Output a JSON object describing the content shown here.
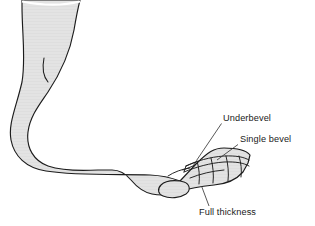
{
  "figure": {
    "colors": {
      "skin_fill": "#e3e3e3",
      "outline": "#1c1c1c",
      "leader_line": "#3a3a3a",
      "label_text": "#1a1a1a",
      "background": "#ffffff"
    },
    "labels": [
      {
        "id": "underbevel",
        "text": "Underbevel",
        "text_x": 223,
        "text_y": 121,
        "leader": "M221.5,123.5 L196.5,160.5"
      },
      {
        "id": "single-bevel",
        "text": "Single bevel",
        "text_x": 240,
        "text_y": 142,
        "leader": "M238,144.5 L217,160"
      },
      {
        "id": "full-thickness",
        "text": "Full thickness",
        "text_x": 199,
        "text_y": 215,
        "leader": "M209,206 L201.5,186"
      }
    ],
    "anatomy": {
      "foot_outline": "M22,0 L22,6 C22,34 26,58 22,82 C16,108 8,124 11,140 C14,156 26,168 46,171 C78,176 120,174 150,175 C162,175.5 172,178 180,181 L196,164 C208,152 214,148 224,148 C236,148 246,150 250,155 L248,163 L243,172 C236,180 226,184 214,185 C200,186.5 190,188 182,191 C172,195 162,196 152,194 C142,192 136,186 131,180 C126,174 120,170 112,170 L98,170 C80,171 60,170 48,166 C34,161 26,148 28,132 C30,116 40,104 48,92 C60,74 70,52 74,30 C76,18 78,8 80,0 Z",
      "leg_top_edge": "M22,1.5 C40,5 62,6 80,1.5",
      "malleolus_mark": "M44,58 C42,68 43,76 48,82",
      "toe_lines": [
        "M186,166 C196,161 210,157 224,156 C236,155.5 244,157 249,160",
        "M184,172 C196,167 210,163 224,162 C236,161.5 244,163 249,166",
        "M190,178 C200,174 212,171 224,170",
        "M168,176 C174,172 182,169 190,168"
      ],
      "toe_separators": [
        "M197,161 C199,168 200,176 199,184",
        "M211,158 C213,166 214,175 213,183",
        "M226,156 C228,164 229,173 228,181",
        "M239,156 C241,163 242,170 241,177"
      ],
      "bevel_cuts": [
        "M186,166 L196,162",
        "M183,170 L193,166",
        "M186,166 L184,172",
        "M193,166 L196,162"
      ],
      "big_toe": "M180,181 C172,180 165,181 161,185 C157,189 158,194 163,196 C170,199 180,198 186,194 C191,190.5 190,184 184,182 Z"
    }
  }
}
